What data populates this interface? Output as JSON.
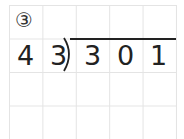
{
  "problem": {
    "label": "③",
    "divisor": [
      "4",
      "3"
    ],
    "dividend": [
      "3",
      "0",
      "1"
    ]
  }
}
